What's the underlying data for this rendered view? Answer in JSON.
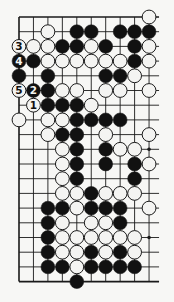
{
  "diagram": {
    "type": "go-board-partial",
    "colors": {
      "background": "#f7f7f5",
      "line": "#1a1a1a",
      "black": "#111111",
      "white": "#f4f4f2",
      "stone_outline": "#1a1a1a"
    },
    "grid": {
      "columns": 10,
      "rows": 19,
      "x0": 19,
      "dx": 14.45,
      "y0": 17,
      "dy": 14.7,
      "right_extension": 10,
      "edges": {
        "top": true,
        "left": true,
        "bottom": true,
        "right": false
      }
    },
    "star_points": [
      [
        9,
        9
      ],
      [
        9,
        15
      ]
    ],
    "stones": [
      {
        "c": 9,
        "r": 0,
        "color": "white"
      },
      {
        "c": 2,
        "r": 1,
        "color": "white"
      },
      {
        "c": 4,
        "r": 1,
        "color": "black"
      },
      {
        "c": 5,
        "r": 1,
        "color": "black"
      },
      {
        "c": 7,
        "r": 1,
        "color": "black"
      },
      {
        "c": 8,
        "r": 1,
        "color": "black"
      },
      {
        "c": 9,
        "r": 1,
        "color": "black"
      },
      {
        "c": 0,
        "r": 2,
        "color": "white",
        "label": "3"
      },
      {
        "c": 1,
        "r": 2,
        "color": "white"
      },
      {
        "c": 2,
        "r": 2,
        "color": "white"
      },
      {
        "c": 3,
        "r": 2,
        "color": "black"
      },
      {
        "c": 4,
        "r": 2,
        "color": "black"
      },
      {
        "c": 5,
        "r": 2,
        "color": "white"
      },
      {
        "c": 6,
        "r": 2,
        "color": "black"
      },
      {
        "c": 8,
        "r": 2,
        "color": "black"
      },
      {
        "c": 9,
        "r": 2,
        "color": "white"
      },
      {
        "c": 0,
        "r": 3,
        "color": "black",
        "label": "4"
      },
      {
        "c": 1,
        "r": 3,
        "color": "black"
      },
      {
        "c": 2,
        "r": 3,
        "color": "white"
      },
      {
        "c": 3,
        "r": 3,
        "color": "white"
      },
      {
        "c": 4,
        "r": 3,
        "color": "white"
      },
      {
        "c": 5,
        "r": 3,
        "color": "white"
      },
      {
        "c": 6,
        "r": 3,
        "color": "white"
      },
      {
        "c": 7,
        "r": 3,
        "color": "white"
      },
      {
        "c": 8,
        "r": 3,
        "color": "black"
      },
      {
        "c": 9,
        "r": 3,
        "color": "white"
      },
      {
        "c": 0,
        "r": 4,
        "color": "black"
      },
      {
        "c": 2,
        "r": 4,
        "color": "black"
      },
      {
        "c": 6,
        "r": 4,
        "color": "black"
      },
      {
        "c": 7,
        "r": 4,
        "color": "black"
      },
      {
        "c": 8,
        "r": 4,
        "color": "white"
      },
      {
        "c": 0,
        "r": 5,
        "color": "white",
        "label": "5"
      },
      {
        "c": 1,
        "r": 5,
        "color": "black",
        "label": "2"
      },
      {
        "c": 2,
        "r": 5,
        "color": "black"
      },
      {
        "c": 3,
        "r": 5,
        "color": "white"
      },
      {
        "c": 4,
        "r": 5,
        "color": "white"
      },
      {
        "c": 6,
        "r": 5,
        "color": "white"
      },
      {
        "c": 7,
        "r": 5,
        "color": "white"
      },
      {
        "c": 9,
        "r": 5,
        "color": "white"
      },
      {
        "c": 1,
        "r": 6,
        "color": "white",
        "label": "1"
      },
      {
        "c": 2,
        "r": 6,
        "color": "black"
      },
      {
        "c": 3,
        "r": 6,
        "color": "black"
      },
      {
        "c": 4,
        "r": 6,
        "color": "black"
      },
      {
        "c": 5,
        "r": 6,
        "color": "white"
      },
      {
        "c": 0,
        "r": 7,
        "color": "white"
      },
      {
        "c": 2,
        "r": 7,
        "color": "white"
      },
      {
        "c": 3,
        "r": 7,
        "color": "white"
      },
      {
        "c": 4,
        "r": 7,
        "color": "black"
      },
      {
        "c": 5,
        "r": 7,
        "color": "black"
      },
      {
        "c": 6,
        "r": 7,
        "color": "black"
      },
      {
        "c": 7,
        "r": 7,
        "color": "black"
      },
      {
        "c": 2,
        "r": 8,
        "color": "white"
      },
      {
        "c": 3,
        "r": 8,
        "color": "black"
      },
      {
        "c": 4,
        "r": 8,
        "color": "black"
      },
      {
        "c": 6,
        "r": 8,
        "color": "white"
      },
      {
        "c": 9,
        "r": 8,
        "color": "white"
      },
      {
        "c": 3,
        "r": 9,
        "color": "white"
      },
      {
        "c": 4,
        "r": 9,
        "color": "black"
      },
      {
        "c": 6,
        "r": 9,
        "color": "black"
      },
      {
        "c": 7,
        "r": 9,
        "color": "white"
      },
      {
        "c": 8,
        "r": 9,
        "color": "white"
      },
      {
        "c": 3,
        "r": 10,
        "color": "white"
      },
      {
        "c": 4,
        "r": 10,
        "color": "black"
      },
      {
        "c": 6,
        "r": 10,
        "color": "black"
      },
      {
        "c": 8,
        "r": 10,
        "color": "black"
      },
      {
        "c": 9,
        "r": 10,
        "color": "white"
      },
      {
        "c": 3,
        "r": 11,
        "color": "white"
      },
      {
        "c": 4,
        "r": 11,
        "color": "black"
      },
      {
        "c": 8,
        "r": 11,
        "color": "black"
      },
      {
        "c": 3,
        "r": 12,
        "color": "white"
      },
      {
        "c": 4,
        "r": 12,
        "color": "white"
      },
      {
        "c": 5,
        "r": 12,
        "color": "black"
      },
      {
        "c": 6,
        "r": 12,
        "color": "white"
      },
      {
        "c": 7,
        "r": 12,
        "color": "white"
      },
      {
        "c": 8,
        "r": 12,
        "color": "white"
      },
      {
        "c": 2,
        "r": 13,
        "color": "black"
      },
      {
        "c": 3,
        "r": 13,
        "color": "black"
      },
      {
        "c": 4,
        "r": 13,
        "color": "white"
      },
      {
        "c": 5,
        "r": 13,
        "color": "black"
      },
      {
        "c": 6,
        "r": 13,
        "color": "black"
      },
      {
        "c": 7,
        "r": 13,
        "color": "black"
      },
      {
        "c": 9,
        "r": 13,
        "color": "white"
      },
      {
        "c": 2,
        "r": 14,
        "color": "black"
      },
      {
        "c": 3,
        "r": 14,
        "color": "white"
      },
      {
        "c": 5,
        "r": 14,
        "color": "white"
      },
      {
        "c": 6,
        "r": 14,
        "color": "white"
      },
      {
        "c": 7,
        "r": 14,
        "color": "black"
      },
      {
        "c": 2,
        "r": 15,
        "color": "black"
      },
      {
        "c": 3,
        "r": 15,
        "color": "white"
      },
      {
        "c": 4,
        "r": 15,
        "color": "white"
      },
      {
        "c": 5,
        "r": 15,
        "color": "white"
      },
      {
        "c": 6,
        "r": 15,
        "color": "white"
      },
      {
        "c": 7,
        "r": 15,
        "color": "white"
      },
      {
        "c": 8,
        "r": 15,
        "color": "white"
      },
      {
        "c": 2,
        "r": 16,
        "color": "black"
      },
      {
        "c": 3,
        "r": 16,
        "color": "white"
      },
      {
        "c": 4,
        "r": 16,
        "color": "white"
      },
      {
        "c": 5,
        "r": 16,
        "color": "black"
      },
      {
        "c": 6,
        "r": 16,
        "color": "white"
      },
      {
        "c": 7,
        "r": 16,
        "color": "black"
      },
      {
        "c": 8,
        "r": 16,
        "color": "white"
      },
      {
        "c": 2,
        "r": 17,
        "color": "black"
      },
      {
        "c": 3,
        "r": 17,
        "color": "black"
      },
      {
        "c": 4,
        "r": 17,
        "color": "white"
      },
      {
        "c": 5,
        "r": 17,
        "color": "black"
      },
      {
        "c": 6,
        "r": 17,
        "color": "black"
      },
      {
        "c": 7,
        "r": 17,
        "color": "black"
      },
      {
        "c": 8,
        "r": 17,
        "color": "black"
      },
      {
        "c": 4,
        "r": 18,
        "color": "black"
      }
    ]
  }
}
